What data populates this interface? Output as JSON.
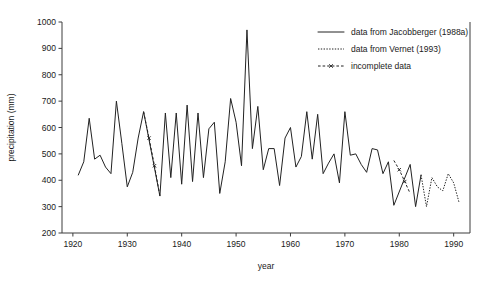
{
  "chart_data": {
    "type": "line",
    "title": "",
    "xlabel": "year",
    "ylabel": "precipitation (mm)",
    "xlim": [
      1918,
      1993
    ],
    "ylim": [
      200,
      1000
    ],
    "xticks": [
      1920,
      1930,
      1940,
      1950,
      1960,
      1970,
      1980,
      1990
    ],
    "yticks": [
      200,
      300,
      400,
      500,
      600,
      700,
      800,
      900,
      1000
    ],
    "grid": false,
    "legend_position": "top-right",
    "series": [
      {
        "name": "data from Jacobberger (1988a)",
        "style": "solid",
        "x": [
          1921,
          1922,
          1923,
          1924,
          1925,
          1926,
          1927,
          1928,
          1929,
          1930,
          1931,
          1932,
          1933,
          1936,
          1937,
          1938,
          1939,
          1940,
          1941,
          1942,
          1943,
          1944,
          1945,
          1946,
          1947,
          1948,
          1949,
          1950,
          1951,
          1952,
          1953,
          1954,
          1955,
          1956,
          1957,
          1958,
          1959,
          1960,
          1961,
          1962,
          1963,
          1964,
          1965,
          1966,
          1967,
          1968,
          1969,
          1970,
          1971,
          1972,
          1973,
          1974,
          1975,
          1976,
          1977,
          1978,
          1979,
          1982,
          1983,
          1984
        ],
        "y": [
          420,
          470,
          635,
          480,
          495,
          450,
          425,
          700,
          540,
          375,
          430,
          560,
          660,
          340,
          655,
          410,
          655,
          385,
          685,
          395,
          655,
          410,
          595,
          620,
          350,
          470,
          710,
          620,
          455,
          970,
          520,
          680,
          440,
          520,
          520,
          380,
          560,
          600,
          450,
          490,
          660,
          480,
          650,
          425,
          465,
          500,
          390,
          660,
          495,
          500,
          460,
          430,
          520,
          515,
          425,
          470,
          305,
          460,
          300,
          420
        ],
        "color": "#222222"
      },
      {
        "name": "data from Vernet (1993)",
        "style": "dotted",
        "x": [
          1984,
          1985,
          1986,
          1987,
          1988,
          1989,
          1990,
          1991
        ],
        "y": [
          420,
          300,
          410,
          375,
          360,
          425,
          390,
          315
        ],
        "color": "#222222"
      },
      {
        "name": "incomplete data",
        "style": "dash-x",
        "segments": [
          {
            "x": [
              1933,
              1934,
              1935,
              1936
            ],
            "y": [
              660,
              560,
              455,
              340
            ]
          },
          {
            "x": [
              1979,
              1980,
              1981,
              1982
            ],
            "y": [
              475,
              440,
              395,
              350
            ]
          }
        ],
        "color": "#222222"
      }
    ]
  },
  "legend": {
    "items": [
      {
        "label": "data from Jacobberger (1988a)",
        "style": "solid"
      },
      {
        "label": "data from Vernet (1993)",
        "style": "dotted"
      },
      {
        "label": "incomplete data",
        "style": "dash-x"
      }
    ]
  },
  "axes": {
    "y_label": "precipitation (mm)",
    "x_label": "year",
    "y_tick_labels": [
      "200",
      "300",
      "400",
      "500",
      "600",
      "700",
      "800",
      "900",
      "1000"
    ],
    "x_tick_labels": [
      "1920",
      "1930",
      "1940",
      "1950",
      "1960",
      "1970",
      "1980",
      "1990"
    ]
  }
}
